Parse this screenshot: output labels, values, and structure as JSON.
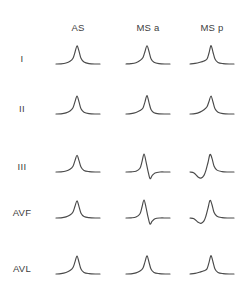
{
  "figure": {
    "title": "",
    "background_color": "#ffffff",
    "trace_color": "#4a4a4a",
    "text_color": "#3d3d3d"
  },
  "columns": [
    {
      "key": "as",
      "label": "AS",
      "x": 78
    },
    {
      "key": "ms_a",
      "label": "MS a",
      "x": 148
    },
    {
      "key": "ms_p",
      "label": "MS p",
      "x": 212
    }
  ],
  "header_y": 22,
  "rows": [
    {
      "key": "lead_i",
      "label": "I",
      "y": 58,
      "label_x": 22
    },
    {
      "key": "lead_ii",
      "label": "II",
      "y": 108,
      "label_x": 22
    },
    {
      "key": "lead_iii",
      "label": "III",
      "y": 166,
      "label_x": 22
    },
    {
      "key": "lead_avf",
      "label": "AVF",
      "y": 212,
      "label_x": 22
    },
    {
      "key": "lead_avl",
      "label": "AVL",
      "y": 268,
      "label_x": 22
    }
  ],
  "chart_data": {
    "type": "line",
    "title": "",
    "subtitle": "",
    "xlabel": "",
    "ylabel": "",
    "grid": false,
    "legend_position": "none",
    "layout": {
      "rows": 5,
      "cols": 3,
      "row_headers": [
        "I",
        "II",
        "III",
        "AVF",
        "AVL"
      ],
      "col_headers": [
        "AS",
        "MS a",
        "MS p"
      ]
    },
    "axis_note": "each cell plots a single beat morphology; x = time (arbitrary), y = amplitude (arbitrary, positive up)",
    "cells": [
      {
        "row": "I",
        "col": "AS",
        "morphology": "positive monophasic; slow upslope, tall narrow peak, rapid downstroke to baseline",
        "x": [
          0,
          5,
          10,
          14,
          17,
          19,
          21,
          23,
          25,
          28,
          33,
          40,
          44
        ],
        "y": [
          0,
          0.01,
          0.05,
          0.14,
          0.3,
          0.62,
          0.95,
          0.68,
          0.3,
          0.1,
          0.02,
          0.0,
          0.0
        ]
      },
      {
        "row": "I",
        "col": "MS a",
        "morphology": "positive monophasic; notched slow upslope then sharp peak",
        "x": [
          0,
          5,
          10,
          14,
          17,
          19,
          21,
          23,
          25,
          28,
          33,
          40,
          44
        ],
        "y": [
          0,
          0.02,
          0.07,
          0.18,
          0.34,
          0.66,
          0.96,
          0.66,
          0.28,
          0.09,
          0.02,
          0.0,
          0.0
        ]
      },
      {
        "row": "I",
        "col": "MS p",
        "morphology": "positive monophasic; low gradual shoulder then tall sharp peak",
        "x": [
          0,
          5,
          10,
          14,
          17,
          19,
          21,
          23,
          25,
          28,
          33,
          40,
          44
        ],
        "y": [
          0,
          0.03,
          0.09,
          0.16,
          0.26,
          0.58,
          0.97,
          0.62,
          0.26,
          0.08,
          0.02,
          0.0,
          0.0
        ]
      },
      {
        "row": "II",
        "col": "AS",
        "morphology": "positive monophasic; broad foot, single tall peak",
        "x": [
          0,
          5,
          10,
          14,
          17,
          19,
          21,
          23,
          25,
          28,
          33,
          40,
          44
        ],
        "y": [
          0,
          0.01,
          0.06,
          0.16,
          0.33,
          0.65,
          0.95,
          0.64,
          0.27,
          0.09,
          0.02,
          0.0,
          0.0
        ]
      },
      {
        "row": "II",
        "col": "MS a",
        "morphology": "positive monophasic; narrow tall peak with slight pre-peak shoulder",
        "x": [
          0,
          5,
          10,
          14,
          17,
          19,
          21,
          23,
          25,
          28,
          33,
          40,
          44
        ],
        "y": [
          0,
          0.02,
          0.08,
          0.18,
          0.32,
          0.64,
          0.97,
          0.6,
          0.24,
          0.07,
          0.01,
          0.0,
          0.0
        ]
      },
      {
        "row": "II",
        "col": "MS p",
        "morphology": "positive monophasic; wider rounded upslope into tall peak",
        "x": [
          0,
          5,
          10,
          14,
          17,
          19,
          21,
          23,
          25,
          28,
          33,
          40,
          44
        ],
        "y": [
          0,
          0.02,
          0.1,
          0.22,
          0.38,
          0.66,
          0.95,
          0.63,
          0.27,
          0.09,
          0.02,
          0.0,
          0.0
        ]
      },
      {
        "row": "III",
        "col": "AS",
        "morphology": "positive monophasic; small peak, low amplitude",
        "x": [
          0,
          5,
          10,
          14,
          17,
          19,
          21,
          23,
          25,
          28,
          33,
          40,
          44
        ],
        "y": [
          0,
          0.01,
          0.05,
          0.14,
          0.3,
          0.6,
          0.88,
          0.6,
          0.26,
          0.08,
          0.02,
          0.0,
          0.0
        ]
      },
      {
        "row": "III",
        "col": "MS a",
        "morphology": "biphasic positive-negative; tall sharp spike followed by deep narrow negative deflection below baseline",
        "x": [
          0,
          5,
          10,
          14,
          16,
          18,
          20,
          22,
          24,
          26,
          29,
          34,
          40,
          44
        ],
        "y": [
          0,
          0.01,
          0.04,
          0.2,
          0.55,
          0.95,
          0.55,
          0.05,
          -0.35,
          -0.2,
          -0.05,
          0.0,
          0.0,
          0.0
        ]
      },
      {
        "row": "III",
        "col": "MS p",
        "morphology": "biphasic negative-positive; initial negative trough then tall positive peak",
        "x": [
          0,
          4,
          8,
          11,
          14,
          16,
          18,
          20,
          22,
          24,
          27,
          32,
          38,
          44
        ],
        "y": [
          0,
          -0.05,
          -0.26,
          -0.32,
          -0.18,
          0.1,
          0.5,
          0.92,
          0.72,
          0.32,
          0.1,
          0.02,
          0.0,
          0.0
        ]
      },
      {
        "row": "AVF",
        "col": "AS",
        "morphology": "positive monophasic; gentle upslope to modest peak",
        "x": [
          0,
          5,
          10,
          14,
          17,
          19,
          21,
          23,
          25,
          28,
          33,
          40,
          44
        ],
        "y": [
          0,
          0.01,
          0.06,
          0.16,
          0.32,
          0.62,
          0.9,
          0.6,
          0.25,
          0.08,
          0.02,
          0.0,
          0.0
        ]
      },
      {
        "row": "AVF",
        "col": "MS a",
        "morphology": "biphasic positive-negative; sharp spike then negative deflection below baseline",
        "x": [
          0,
          5,
          10,
          14,
          16,
          18,
          20,
          22,
          24,
          26,
          29,
          34,
          40,
          44
        ],
        "y": [
          0,
          0.01,
          0.05,
          0.22,
          0.58,
          0.95,
          0.56,
          0.06,
          -0.32,
          -0.18,
          -0.04,
          0.0,
          0.0,
          0.0
        ]
      },
      {
        "row": "AVF",
        "col": "MS p",
        "morphology": "biphasic negative-positive; shallow negative trough then tall peak",
        "x": [
          0,
          4,
          8,
          11,
          14,
          16,
          18,
          20,
          22,
          24,
          27,
          32,
          38,
          44
        ],
        "y": [
          0,
          -0.04,
          -0.22,
          -0.28,
          -0.15,
          0.12,
          0.52,
          0.93,
          0.7,
          0.3,
          0.09,
          0.02,
          0.0,
          0.0
        ]
      },
      {
        "row": "AVL",
        "col": "AS",
        "morphology": "positive monophasic; slow ramp then tall narrow peak",
        "x": [
          0,
          5,
          10,
          14,
          17,
          19,
          21,
          23,
          25,
          28,
          33,
          40,
          44
        ],
        "y": [
          0,
          0.02,
          0.08,
          0.18,
          0.34,
          0.64,
          0.95,
          0.62,
          0.26,
          0.08,
          0.02,
          0.0,
          0.0
        ]
      },
      {
        "row": "AVL",
        "col": "MS a",
        "morphology": "positive monophasic; narrow tall peak",
        "x": [
          0,
          5,
          10,
          14,
          17,
          19,
          21,
          23,
          25,
          28,
          33,
          40,
          44
        ],
        "y": [
          0,
          0.01,
          0.06,
          0.16,
          0.32,
          0.64,
          0.96,
          0.62,
          0.26,
          0.08,
          0.02,
          0.0,
          0.0
        ]
      },
      {
        "row": "AVL",
        "col": "MS p",
        "morphology": "positive monophasic; low shoulder then tall sharp peak",
        "x": [
          0,
          5,
          10,
          14,
          17,
          19,
          21,
          23,
          25,
          28,
          33,
          40,
          44
        ],
        "y": [
          0,
          0.03,
          0.1,
          0.17,
          0.27,
          0.6,
          0.97,
          0.63,
          0.26,
          0.08,
          0.02,
          0.0,
          0.0
        ]
      }
    ]
  }
}
